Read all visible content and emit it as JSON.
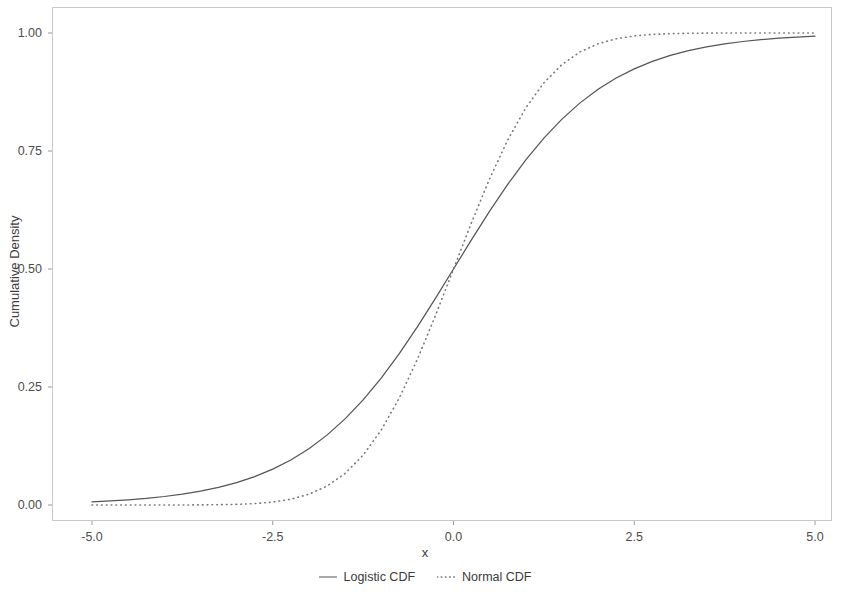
{
  "chart_data": {
    "type": "line",
    "title": "",
    "xlabel": "x",
    "ylabel": "Cumulative Density",
    "xlim": [
      -5.2,
      5.2
    ],
    "ylim": [
      -0.03,
      1.03
    ],
    "xticks": [
      "-5.0",
      "-2.5",
      "0.0",
      "2.5",
      "5.0"
    ],
    "xtick_values": [
      -5.0,
      -2.5,
      0.0,
      2.5,
      5.0
    ],
    "yticks": [
      "0.00",
      "0.25",
      "0.50",
      "0.75",
      "1.00"
    ],
    "ytick_values": [
      0.0,
      0.25,
      0.5,
      0.75,
      1.0
    ],
    "grid": false,
    "legend_position": "bottom",
    "x": [
      -5.0,
      -4.75,
      -4.5,
      -4.25,
      -4.0,
      -3.75,
      -3.5,
      -3.25,
      -3.0,
      -2.75,
      -2.5,
      -2.25,
      -2.0,
      -1.75,
      -1.5,
      -1.25,
      -1.0,
      -0.75,
      -0.5,
      -0.25,
      0.0,
      0.25,
      0.5,
      0.75,
      1.0,
      1.25,
      1.5,
      1.75,
      2.0,
      2.25,
      2.5,
      2.75,
      3.0,
      3.25,
      3.5,
      3.75,
      4.0,
      4.25,
      4.5,
      4.75,
      5.0
    ],
    "series": [
      {
        "name": "Logistic CDF",
        "linestyle": "solid",
        "color": "#555555",
        "values": [
          0.0067,
          0.0086,
          0.011,
          0.014,
          0.018,
          0.023,
          0.0293,
          0.0373,
          0.0474,
          0.0601,
          0.0759,
          0.0953,
          0.1192,
          0.148,
          0.1824,
          0.2227,
          0.2689,
          0.3208,
          0.3775,
          0.4378,
          0.5,
          0.5622,
          0.6225,
          0.6792,
          0.7311,
          0.7773,
          0.8176,
          0.852,
          0.8808,
          0.9047,
          0.9241,
          0.9399,
          0.9526,
          0.9627,
          0.9707,
          0.977,
          0.982,
          0.986,
          0.989,
          0.9914,
          0.9933
        ]
      },
      {
        "name": "Normal CDF",
        "linestyle": "dotted",
        "color": "#777777",
        "values": [
          3e-07,
          1e-06,
          3.4e-06,
          1.07e-05,
          3.17e-05,
          8.84e-05,
          0.000233,
          0.000577,
          0.00135,
          0.00298,
          0.00621,
          0.01222,
          0.02275,
          0.04006,
          0.06681,
          0.10565,
          0.15866,
          0.22663,
          0.30854,
          0.40129,
          0.5,
          0.59871,
          0.69146,
          0.77337,
          0.84134,
          0.89435,
          0.93319,
          0.95994,
          0.97725,
          0.98778,
          0.99379,
          0.99702,
          0.99865,
          0.99942,
          0.99977,
          0.99991,
          0.99997,
          0.99999,
          0.999997,
          0.999999,
          1.0
        ]
      }
    ]
  },
  "axis": {
    "x_title": "x",
    "y_title": "Cumulative Density"
  },
  "legend": {
    "items": [
      {
        "label": "Logistic CDF",
        "key": "solid-line-key"
      },
      {
        "label": "Normal CDF",
        "key": "dotted-line-key"
      }
    ]
  },
  "colors": {
    "logistic": "#555555",
    "normal": "#777777",
    "panel_border": "#c9c9c9",
    "tick_text": "#4d4d4d",
    "background": "#ffffff"
  }
}
